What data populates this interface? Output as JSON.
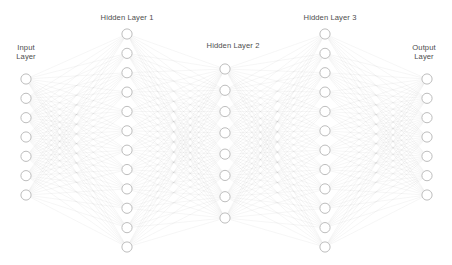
{
  "diagram": {
    "canvas": {
      "width": 452,
      "height": 265,
      "background": "#ffffff"
    },
    "style": {
      "node_fill": "#ffffff",
      "node_stroke": "#b5b5b5",
      "node_radius": 5.1,
      "edge_color": "#8f8f8f",
      "edge_opacity": 0.3,
      "label_color": "#4d4d4d"
    },
    "layers": [
      {
        "id": "input-layer",
        "label": "Input\nLayer",
        "node_count": 7,
        "x": 26,
        "y_top": 79,
        "y_bottom": 195,
        "label_x": 26,
        "label_y": 43
      },
      {
        "id": "hidden-layer-1",
        "label": "Hidden Layer 1",
        "node_count": 12,
        "x": 127,
        "y_top": 34,
        "y_bottom": 247,
        "label_x": 127,
        "label_y": 13
      },
      {
        "id": "hidden-layer-2",
        "label": "Hidden Layer 2",
        "node_count": 8,
        "x": 225,
        "y_top": 69,
        "y_bottom": 218,
        "label_x": 233,
        "label_y": 41
      },
      {
        "id": "hidden-layer-3",
        "label": "Hidden Layer 3",
        "node_count": 12,
        "x": 325,
        "y_top": 34,
        "y_bottom": 247,
        "label_x": 330,
        "label_y": 13
      },
      {
        "id": "output-layer",
        "label": "Output\nLayer",
        "node_count": 7,
        "x": 427,
        "y_top": 79,
        "y_bottom": 195,
        "label_x": 424,
        "label_y": 43
      }
    ]
  }
}
